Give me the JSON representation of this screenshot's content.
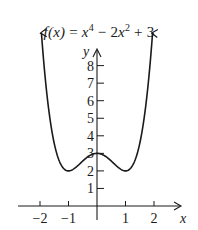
{
  "chart_data": {
    "type": "line",
    "title_parts": {
      "fx": "f(x)",
      "eq": " = ",
      "x1": "x",
      "e1": "4",
      "mid": " − 2",
      "x2": "x",
      "e2": "2",
      "tail": " + 3"
    },
    "xlabel": "x",
    "ylabel": "y",
    "x_ticks": [
      -2,
      -1,
      1,
      2
    ],
    "x_tick_labels": [
      "−2",
      "−1",
      "1",
      "2"
    ],
    "y_ticks": [
      1,
      2,
      3,
      4,
      5,
      6,
      7,
      8
    ],
    "y_tick_labels": [
      "1",
      "2",
      "3",
      "4",
      "5",
      "6",
      "7",
      "8"
    ],
    "xlim": [
      -2.6,
      2.7
    ],
    "ylim": [
      0,
      8.9
    ],
    "grid": false,
    "legend": null,
    "series": [
      {
        "name": "f(x) = x^4 − 2x^2 + 3",
        "function": "x^4 - 2x^2 + 3",
        "x": [
          -1.95,
          -1.75,
          -1.5,
          -1.25,
          -1.0,
          -0.75,
          -0.5,
          -0.25,
          0,
          0.25,
          0.5,
          0.75,
          1.0,
          1.25,
          1.5,
          1.75,
          1.95
        ],
        "values": [
          8.85,
          6.25,
          3.56,
          2.32,
          2.0,
          2.19,
          2.56,
          2.88,
          3.0,
          2.88,
          2.56,
          2.19,
          2.0,
          2.32,
          3.56,
          6.25,
          8.85
        ],
        "end_arrows": true
      }
    ],
    "key_points": [
      {
        "label": "local max",
        "x": 0,
        "y": 3
      },
      {
        "label": "local min",
        "x": -1,
        "y": 2
      },
      {
        "label": "local min",
        "x": 1,
        "y": 2
      }
    ],
    "colors": {
      "curve": "#1a1a1a",
      "axes": "#1a1a1a",
      "background": "#ffffff"
    }
  }
}
